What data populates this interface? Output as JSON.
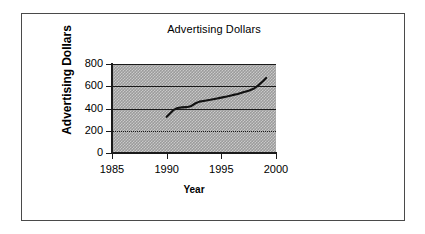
{
  "figure": {
    "title": "Advertising Dollars",
    "background_color": "#ffffff",
    "border_color": "#4a4a4a",
    "plot_fill_color": "#9b9b9b",
    "series_color": "#111111"
  },
  "axes": {
    "x_title": "Year",
    "y_title_line1": "Advertising",
    "y_title_line2": "Dollars",
    "x_ticks": [
      "1985",
      "1990",
      "1995",
      "2000"
    ],
    "y_ticks": [
      "800",
      "600",
      "400",
      "200",
      "0"
    ]
  },
  "chart_data": {
    "type": "line",
    "title": "Advertising Dollars",
    "xlabel": "Year",
    "ylabel": "Advertising Dollars",
    "xlim": [
      1985,
      2000
    ],
    "ylim": [
      0,
      800
    ],
    "xticks": [
      1985,
      1990,
      1995,
      2000
    ],
    "yticks": [
      0,
      200,
      400,
      600,
      800
    ],
    "grid": true,
    "legend": false,
    "series": [
      {
        "name": "Advertising Dollars",
        "x": [
          1990.0,
          1990.3,
          1990.6,
          1991.0,
          1991.4,
          1991.8,
          1992.2,
          1992.6,
          1993.0,
          1993.5,
          1994.0,
          1994.5,
          1995.0,
          1995.5,
          1996.0,
          1996.5,
          1997.0,
          1997.5,
          1998.0,
          1998.4,
          1998.8,
          1999.1
        ],
        "y": [
          325,
          355,
          385,
          405,
          410,
          412,
          420,
          445,
          462,
          470,
          478,
          488,
          498,
          508,
          520,
          530,
          545,
          560,
          580,
          610,
          645,
          675
        ]
      }
    ]
  }
}
